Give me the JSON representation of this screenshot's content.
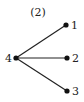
{
  "diagram": {
    "title": "(2)",
    "type": "star-graph",
    "colors": {
      "edge": "#222222",
      "node": "#111111",
      "text": "#222222"
    },
    "nodes": [
      {
        "id": "4",
        "label": "4",
        "x": 16,
        "y": 58
      },
      {
        "id": "1",
        "label": "1",
        "x": 66,
        "y": 25
      },
      {
        "id": "2",
        "label": "2",
        "x": 67,
        "y": 58
      },
      {
        "id": "3",
        "label": "3",
        "x": 67,
        "y": 91
      }
    ],
    "edges": [
      {
        "from": "4",
        "to": "1"
      },
      {
        "from": "4",
        "to": "2"
      },
      {
        "from": "4",
        "to": "3"
      }
    ]
  }
}
